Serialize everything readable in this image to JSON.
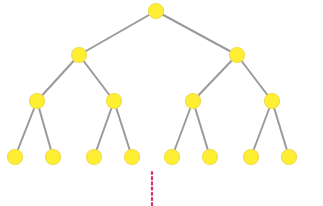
{
  "diagram": {
    "type": "binary-tree",
    "levels": 4,
    "node_radius": 7.5,
    "colors": {
      "node_fill": "#ffef33",
      "node_stroke": "#f2dc4a",
      "edge": "#9a9a9a",
      "continuation": "#d6336c",
      "background": "#ffffff"
    },
    "nodes": [
      {
        "id": "n0",
        "level": 0,
        "x": 156,
        "y": 11
      },
      {
        "id": "n1",
        "level": 1,
        "x": 79,
        "y": 55
      },
      {
        "id": "n2",
        "level": 1,
        "x": 237,
        "y": 55
      },
      {
        "id": "n3",
        "level": 2,
        "x": 37,
        "y": 101
      },
      {
        "id": "n4",
        "level": 2,
        "x": 114,
        "y": 101
      },
      {
        "id": "n5",
        "level": 2,
        "x": 193,
        "y": 101
      },
      {
        "id": "n6",
        "level": 2,
        "x": 272,
        "y": 101
      },
      {
        "id": "n7",
        "level": 3,
        "x": 15,
        "y": 157
      },
      {
        "id": "n8",
        "level": 3,
        "x": 53,
        "y": 157
      },
      {
        "id": "n9",
        "level": 3,
        "x": 94,
        "y": 157
      },
      {
        "id": "n10",
        "level": 3,
        "x": 132,
        "y": 157
      },
      {
        "id": "n11",
        "level": 3,
        "x": 172,
        "y": 157
      },
      {
        "id": "n12",
        "level": 3,
        "x": 210,
        "y": 157
      },
      {
        "id": "n13",
        "level": 3,
        "x": 251,
        "y": 157
      },
      {
        "id": "n14",
        "level": 3,
        "x": 289,
        "y": 157
      }
    ],
    "edges": [
      [
        "n0",
        "n1"
      ],
      [
        "n0",
        "n2"
      ],
      [
        "n1",
        "n3"
      ],
      [
        "n1",
        "n4"
      ],
      [
        "n2",
        "n5"
      ],
      [
        "n2",
        "n6"
      ],
      [
        "n3",
        "n7"
      ],
      [
        "n3",
        "n8"
      ],
      [
        "n4",
        "n9"
      ],
      [
        "n4",
        "n10"
      ],
      [
        "n5",
        "n11"
      ],
      [
        "n5",
        "n12"
      ],
      [
        "n6",
        "n13"
      ],
      [
        "n6",
        "n14"
      ]
    ],
    "continuation": {
      "style": "dotted-vertical-line",
      "x": 152,
      "y1": 172,
      "y2": 205
    }
  }
}
